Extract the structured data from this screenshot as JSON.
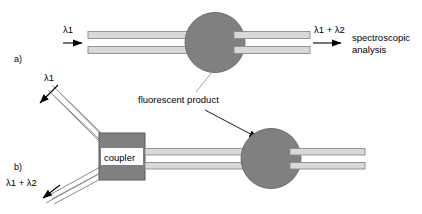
{
  "figure": {
    "panels": [
      {
        "id": "a",
        "label": "a)",
        "input_label": "λ1",
        "output_label": "λ1 + λ2",
        "analysis_label_line1": "spectroscopic",
        "analysis_label_line2": "analysis"
      },
      {
        "id": "b",
        "label": "b)",
        "output_label": "λ1",
        "input_label": "λ1 + λ2",
        "coupler_label": "coupler"
      }
    ],
    "annotation": {
      "text": "fluorescent product"
    },
    "colors": {
      "background": "#ffffff",
      "stroke": "#000000",
      "circle_fill": "#808080",
      "circle_stroke": "#6e6e6e",
      "coupler_fill": "#808080",
      "coupler_stroke": "#5a5a5a",
      "fiber_fill": "#d9d9d9",
      "fiber_stroke": "#8c8c8c",
      "fiber_core": "#f2f2f2",
      "leader_line": "#9a9a9a",
      "coupler_label_bg": "#ffffff"
    }
  }
}
